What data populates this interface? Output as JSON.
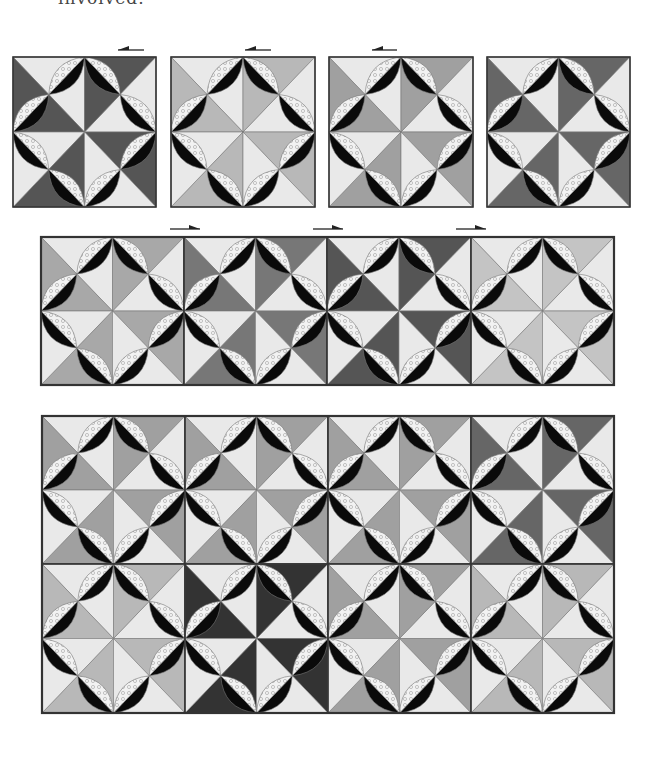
{
  "caption_fragment": "involved.",
  "colors": {
    "light": "#e9e9e9",
    "seam": "#777777",
    "border": "#333333",
    "melon_black": "#0a0a0a",
    "melon_print": "#f2f2f2",
    "melon_print_dot": "#bdbdbd",
    "arrow": "#222222"
  },
  "rows": [
    {
      "name": "top-row-separate-blocks",
      "joined": false,
      "y": 57,
      "block_h": 150,
      "blocks": [
        {
          "x": 13,
          "w": 143,
          "dark": "#555555"
        },
        {
          "x": 171,
          "w": 144,
          "dark": "#b8b8b8"
        },
        {
          "x": 329,
          "w": 144,
          "dark": "#a0a0a0"
        },
        {
          "x": 487,
          "w": 143,
          "dark": "#666666"
        }
      ]
    },
    {
      "name": "middle-row-joined-blocks",
      "joined": true,
      "y": 237,
      "block_h": 148,
      "blocks": [
        {
          "x": 41,
          "w": 143,
          "dark": "#a8a8a8"
        },
        {
          "x": 184,
          "w": 143,
          "dark": "#777777"
        },
        {
          "x": 327,
          "w": 144,
          "dark": "#555555"
        },
        {
          "x": 471,
          "w": 143,
          "dark": "#c4c4c4"
        }
      ]
    },
    {
      "name": "bottom-panel-row-1",
      "joined": true,
      "y": 416,
      "block_h": 148,
      "blocks": [
        {
          "x": 42,
          "w": 143,
          "dark": "#a0a0a0"
        },
        {
          "x": 185,
          "w": 143,
          "dark": "#a0a0a0"
        },
        {
          "x": 328,
          "w": 143,
          "dark": "#a0a0a0"
        },
        {
          "x": 471,
          "w": 143,
          "dark": "#666666"
        }
      ]
    },
    {
      "name": "bottom-panel-row-2",
      "joined": true,
      "y": 564,
      "block_h": 149,
      "blocks": [
        {
          "x": 42,
          "w": 143,
          "dark": "#b8b8b8"
        },
        {
          "x": 185,
          "w": 143,
          "dark": "#333333"
        },
        {
          "x": 328,
          "w": 143,
          "dark": "#a0a0a0"
        },
        {
          "x": 471,
          "w": 143,
          "dark": "#b8b8b8"
        }
      ]
    }
  ],
  "frames": [
    {
      "name": "middle-row-frame",
      "x": 41,
      "y": 237,
      "w": 573,
      "h": 148
    },
    {
      "name": "bottom-panel-frame",
      "x": 42,
      "y": 416,
      "w": 572,
      "h": 297
    }
  ],
  "arrows": [
    {
      "name": "arrow-left-1",
      "direction": "left",
      "x1": 118,
      "x2": 144,
      "y": 50
    },
    {
      "name": "arrow-left-2",
      "direction": "left",
      "x1": 245,
      "x2": 271,
      "y": 50
    },
    {
      "name": "arrow-left-3",
      "direction": "left",
      "x1": 372,
      "x2": 397,
      "y": 50
    },
    {
      "name": "arrow-right-1",
      "direction": "right",
      "x1": 170,
      "x2": 200,
      "y": 229
    },
    {
      "name": "arrow-right-2",
      "direction": "right",
      "x1": 313,
      "x2": 343,
      "y": 229
    },
    {
      "name": "arrow-right-3",
      "direction": "right",
      "x1": 456,
      "x2": 486,
      "y": 229
    }
  ]
}
